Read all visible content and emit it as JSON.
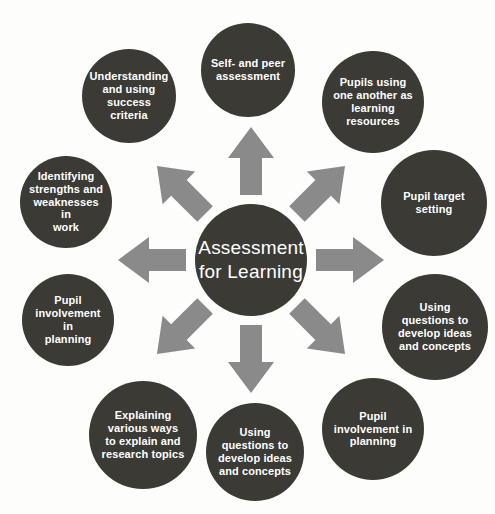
{
  "diagram": {
    "title": "Assessment for Learning",
    "type": "radial-hub-and-spoke",
    "background_color": "#fdfdfc",
    "node_color": "#3b3a35",
    "node_text_color": "#ffffff",
    "arrow_color": "#8a8a8a",
    "center": {
      "label": "Assessment\nfor Learning",
      "cx": 251,
      "cy": 260,
      "r": 56
    },
    "arrow_count": 8,
    "nodes": [
      {
        "id": "self-and-peer-assessment",
        "label": "Self- and peer\nassessment",
        "cx": 248,
        "cy": 70,
        "r": 47,
        "font_size": 11,
        "position": "top"
      },
      {
        "id": "pupils-using-one-another",
        "label": "Pupils using\none another as\nlearning\nresources",
        "cx": 373,
        "cy": 102,
        "r": 51,
        "font_size": 11,
        "position": "top-right"
      },
      {
        "id": "pupil-target-setting",
        "label": "Pupil target\nsetting",
        "cx": 434,
        "cy": 203,
        "r": 53,
        "font_size": 11,
        "position": "right-upper"
      },
      {
        "id": "using-questions-right",
        "label": "Using\nquestions to\ndevelop ideas\nand concepts",
        "cx": 435,
        "cy": 327,
        "r": 53,
        "font_size": 11,
        "position": "right-lower"
      },
      {
        "id": "pupil-involvement-bottom-right",
        "label": "Pupil\ninvolvement in\nplanning",
        "cx": 373,
        "cy": 429,
        "r": 51,
        "font_size": 11,
        "position": "bottom-right"
      },
      {
        "id": "using-questions-bottom",
        "label": "Using\nquestions to\ndevelop ideas\nand concepts",
        "cx": 255,
        "cy": 452,
        "r": 49,
        "font_size": 11,
        "position": "bottom"
      },
      {
        "id": "explaining-various-ways",
        "label": "Explaining\nvarious ways\nto explain and\nresearch topics",
        "cx": 143,
        "cy": 435,
        "r": 54,
        "font_size": 11,
        "position": "bottom-left"
      },
      {
        "id": "pupil-involvement-left",
        "label": "Pupil\ninvolvement in\nplanning",
        "cx": 68,
        "cy": 320,
        "r": 46,
        "font_size": 11,
        "position": "left-lower"
      },
      {
        "id": "identifying-strengths-weaknesses",
        "label": "Identifying\nstrengths and\nweaknesses in\nwork",
        "cx": 66,
        "cy": 202,
        "r": 46,
        "font_size": 11,
        "position": "left-upper"
      },
      {
        "id": "understanding-success-criteria",
        "label": "Understanding\nand using\nsuccess criteria",
        "cx": 129,
        "cy": 96,
        "r": 47,
        "font_size": 11,
        "position": "top-left"
      }
    ],
    "arrows": [
      {
        "id": "arrow-up",
        "angle": -90
      },
      {
        "id": "arrow-up-right",
        "angle": -45
      },
      {
        "id": "arrow-right",
        "angle": 0
      },
      {
        "id": "arrow-down-right",
        "angle": 45
      },
      {
        "id": "arrow-down",
        "angle": 90
      },
      {
        "id": "arrow-down-left",
        "angle": 135
      },
      {
        "id": "arrow-left",
        "angle": 180
      },
      {
        "id": "arrow-up-left",
        "angle": -135
      }
    ]
  }
}
